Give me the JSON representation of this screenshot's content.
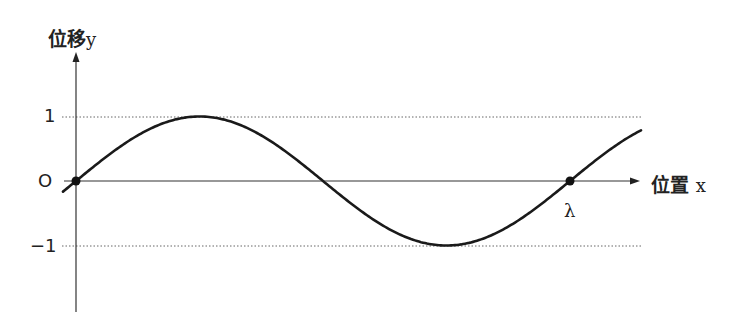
{
  "diagram": {
    "type": "sine-wave",
    "y_axis": {
      "label": "位移",
      "variable": "y"
    },
    "x_axis": {
      "label": "位置",
      "variable": "x"
    },
    "ticks": {
      "top": "1",
      "origin": "O",
      "bottom": "−1"
    },
    "wavelength_label": "λ",
    "points": [
      {
        "name": "origin",
        "x": 0,
        "y": 0
      },
      {
        "name": "lambda",
        "x": "λ",
        "y": 0
      }
    ],
    "curve_color": "#1a1a1a",
    "axis_color": "#333333"
  },
  "chart_data": {
    "type": "line",
    "title": "",
    "xlabel": "位置 x",
    "ylabel": "位移 y",
    "ytick_labels": [
      "1",
      "O",
      "−1"
    ],
    "xtick_labels": [
      "O",
      "λ"
    ],
    "ylim": [
      -1,
      1
    ],
    "series": [
      {
        "name": "y = sin(2πx/λ)",
        "x": [
          "0",
          "λ/4",
          "λ/2",
          "3λ/4",
          "λ"
        ],
        "values": [
          0,
          1,
          0,
          -1,
          0
        ]
      }
    ],
    "grid": false,
    "reference_lines": [
      1,
      -1
    ]
  }
}
